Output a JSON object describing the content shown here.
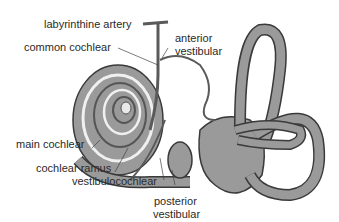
{
  "diagram": {
    "colors": {
      "background": "#ffffff",
      "tissue_fill": "#9a9a9a",
      "outline": "#3a3a3a",
      "vessel": "#5a5a5a",
      "text": "#2a2a2a"
    },
    "labels": {
      "labyrinthine_artery": "labyrinthine artery",
      "common_cochlear": "common cochlear",
      "anterior_vestibular_1": "anterior",
      "anterior_vestibular_2": "vestibular",
      "main_cochlear": "main cochlear",
      "cochlear_ramus": "cochlear ramus",
      "vestibulocochlear": "vestibulocochlear",
      "posterior_vestibular_1": "posterior",
      "posterior_vestibular_2": "vestibular"
    }
  }
}
